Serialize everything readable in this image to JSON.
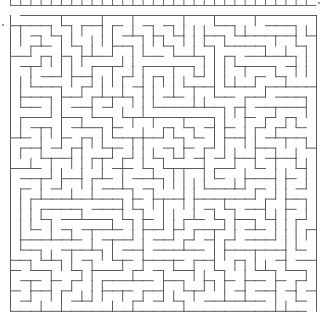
{
  "maze": {
    "origin_x": 10.5,
    "origin_y": 15.5,
    "cols": 30,
    "rows": 29,
    "cell": 10.2,
    "seed": 424242,
    "wall_color": "#5a5a5a",
    "wall_width": 1,
    "entrance": {
      "side": "top",
      "col": 0
    },
    "exit": {
      "side": "bottom",
      "col": 29
    }
  },
  "previous_maze_strip": {
    "y": 5.5,
    "x_start": 10.5,
    "x_end": 316,
    "cell": 10.2,
    "color": "#6a6a6a"
  },
  "markers": [
    {
      "name": "left-edge-marker",
      "x": 2,
      "y": 24
    },
    {
      "name": "right-edge-marker",
      "x": 318,
      "y": 2
    }
  ]
}
